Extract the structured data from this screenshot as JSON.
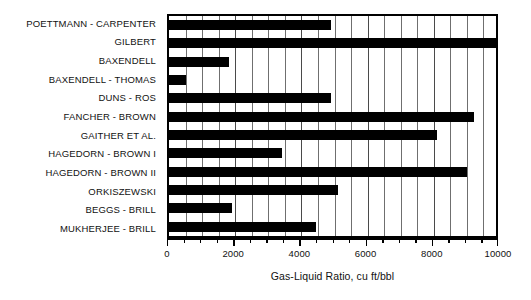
{
  "chart_data": {
    "type": "bar",
    "orientation": "horizontal",
    "title": "",
    "xlabel": "Gas-Liquid Ratio, cu ft/bbl",
    "ylabel": "",
    "xlim": [
      0,
      10000
    ],
    "xticks": [
      0,
      2000,
      4000,
      6000,
      8000,
      10000
    ],
    "xticklabels": [
      "0",
      "2000",
      "4000",
      "6000",
      "8000",
      "10000"
    ],
    "minor_tick_interval": 500,
    "grid": "vertical gridlines every 500 units",
    "legend": "none",
    "bar_color": "#000000",
    "plot_background": "#ffffff",
    "categories": [
      "POETTMANN - CARPENTER",
      "GILBERT",
      "BAXENDELL",
      "BAXENDELL - THOMAS",
      "DUNS - ROS",
      "FANCHER - BROWN",
      "GAITHER ET AL.",
      "HAGEDORN - BROWN I",
      "HAGEDORN - BROWN II",
      "ORKISZEWSKI",
      "BEGGS - BRILL",
      "MUKHERJEE - BRILL"
    ],
    "values": [
      4900,
      10000,
      1800,
      500,
      4900,
      9200,
      8100,
      3400,
      9000,
      5100,
      1900,
      4450
    ]
  }
}
